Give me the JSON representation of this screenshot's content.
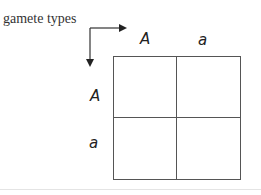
{
  "diagram": {
    "caption": "gamete types",
    "type": "punnett-square",
    "column_gametes": [
      "A",
      "a"
    ],
    "row_gametes": [
      "A",
      "a"
    ],
    "cells": [
      [
        "",
        ""
      ],
      [
        "",
        ""
      ]
    ],
    "colors": {
      "line": "#555555",
      "text": "#333333",
      "background": "#ffffff"
    }
  }
}
